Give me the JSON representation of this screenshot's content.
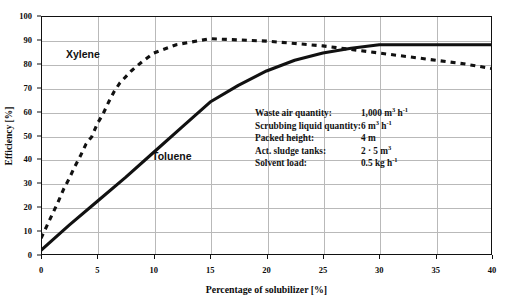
{
  "chart_data": {
    "type": "line",
    "title": "",
    "xlabel": "Percentage of solubilizer [%]",
    "ylabel": "Efficiency [%]",
    "xlim": [
      0,
      40
    ],
    "ylim": [
      0,
      100
    ],
    "xticks": [
      0,
      5,
      10,
      15,
      20,
      25,
      30,
      35,
      40
    ],
    "yticks": [
      0,
      10,
      20,
      30,
      40,
      50,
      60,
      70,
      80,
      90,
      100
    ],
    "grid": true,
    "legend_position": "inline-annotations",
    "series": [
      {
        "name": "Xylene",
        "style": "dashed",
        "color": "#111111",
        "x": [
          0,
          0.5,
          1,
          1.5,
          2,
          2.5,
          3,
          3.5,
          4,
          4.5,
          5,
          5.5,
          6,
          6.5,
          7,
          8,
          9,
          10,
          12,
          15,
          17.5,
          20,
          22.5,
          25,
          27.5,
          30,
          32.5,
          35,
          37.5,
          40
        ],
        "values": [
          7,
          12,
          17,
          22,
          27.5,
          32,
          37,
          41.5,
          46.5,
          49.5,
          55,
          59,
          64,
          68.5,
          72,
          77,
          81,
          84.5,
          88,
          90.5,
          90,
          89.5,
          88.5,
          87.5,
          86,
          84.5,
          83,
          81.5,
          80,
          78
        ]
      },
      {
        "name": "Toluene",
        "style": "solid",
        "color": "#111111",
        "x": [
          0,
          2.5,
          5,
          7.5,
          10,
          12.5,
          15,
          17.5,
          20,
          22.5,
          25,
          27.5,
          30,
          32.5,
          35,
          37.5,
          40
        ],
        "values": [
          2,
          12.5,
          22.5,
          32.5,
          43,
          53.5,
          64,
          71,
          77,
          81.5,
          84.5,
          86.5,
          88,
          88,
          88,
          88,
          88
        ]
      }
    ],
    "annotations": [
      {
        "label": "Xylene"
      },
      {
        "label": "Toluene"
      }
    ]
  },
  "series_labels": {
    "xylene": "Xylene",
    "toluene": "Toluene"
  },
  "axes": {
    "x_title": "Percentage of solubilizer [%]",
    "y_title": "Efficiency [%]",
    "x_ticks": [
      "0",
      "5",
      "10",
      "15",
      "20",
      "25",
      "30",
      "35",
      "40"
    ],
    "y_ticks": [
      "0",
      "10",
      "20",
      "30",
      "40",
      "50",
      "60",
      "70",
      "80",
      "90",
      "100"
    ]
  },
  "parameters": {
    "rows": [
      {
        "key": "Waste air quantity:",
        "value": "1,000 m³ h⁻¹"
      },
      {
        "key": "Scrubbing liquid quantity:",
        "value": "6 m³ h⁻¹"
      },
      {
        "key": "Packed height:",
        "value": "4 m"
      },
      {
        "key": "Act. sludge tanks:",
        "value": "2 · 5 m³"
      },
      {
        "key": "Solvent load:",
        "value": "0.5 kg h⁻¹"
      }
    ]
  },
  "colors": {
    "axis": "#111111",
    "grid": "#b9b9b9",
    "series": "#111111",
    "background": "#ffffff"
  }
}
